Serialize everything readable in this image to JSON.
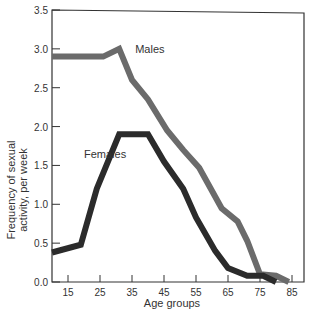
{
  "chart_data": {
    "type": "line",
    "title": "",
    "xlabel": "Age groups",
    "ylabel_lines": [
      "Frequency of sexual",
      "activity, per week"
    ],
    "ylabel": "Frequency of sexual activity, per week",
    "xlim": [
      10,
      87
    ],
    "ylim": [
      0,
      3.5
    ],
    "x_ticks": [
      15,
      25,
      35,
      45,
      55,
      65,
      75,
      85
    ],
    "y_ticks": [
      "0.0",
      "0.5",
      "1.0",
      "1.5",
      "2.0",
      "2.5",
      "3.0",
      "3.5"
    ],
    "grid": false,
    "legend_position": "inline labels",
    "series": [
      {
        "name": "Males",
        "color": "#6b6b6b",
        "points": [
          [
            10,
            2.9
          ],
          [
            26,
            2.9
          ],
          [
            31,
            3.0
          ],
          [
            35,
            2.6
          ],
          [
            40,
            2.35
          ],
          [
            46,
            1.95
          ],
          [
            51,
            1.7
          ],
          [
            56,
            1.47
          ],
          [
            63,
            0.95
          ],
          [
            68,
            0.78
          ],
          [
            71,
            0.53
          ],
          [
            75,
            0.1
          ],
          [
            80,
            0.08
          ],
          [
            84,
            0.0
          ]
        ]
      },
      {
        "name": "Females",
        "color": "#2b2b2b",
        "points": [
          [
            10,
            0.38
          ],
          [
            19,
            0.48
          ],
          [
            24,
            1.2
          ],
          [
            31,
            1.9
          ],
          [
            40,
            1.9
          ],
          [
            45,
            1.55
          ],
          [
            51,
            1.2
          ],
          [
            55,
            0.83
          ],
          [
            61,
            0.4
          ],
          [
            65,
            0.18
          ],
          [
            71,
            0.08
          ],
          [
            76,
            0.08
          ],
          [
            80,
            0.0
          ]
        ]
      }
    ],
    "annotations": [
      {
        "text": "Males",
        "x": 36,
        "y": 2.95
      },
      {
        "text": "Females",
        "x": 20,
        "y": 1.6
      }
    ]
  }
}
